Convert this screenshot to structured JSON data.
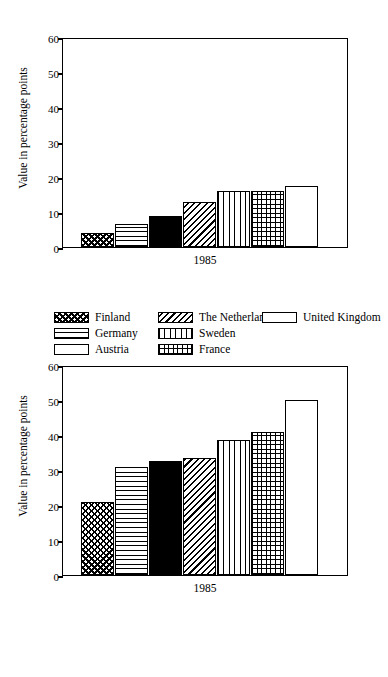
{
  "clipped_top_text": "",
  "figures": [
    {
      "id": "figure-1",
      "ylabel": "Value in percentage points",
      "xlabel": "1985",
      "yticks": [
        "0",
        "10",
        "20",
        "30",
        "40",
        "50",
        "60"
      ],
      "legend": [
        [
          "Finland",
          "Germany",
          "Austria"
        ],
        [
          "The Netherlands",
          "Sweden",
          "France"
        ],
        [
          "United Kingdom"
        ]
      ]
    },
    {
      "id": "figure-2",
      "ylabel": "Value in percentage points",
      "xlabel": "1985",
      "yticks": [
        "0",
        "10",
        "20",
        "30",
        "40",
        "50",
        "60"
      ],
      "legend": [
        [
          "Denmark",
          "Belgium",
          "Italy"
        ],
        [
          "Spain",
          "Portugal",
          "Ireland"
        ],
        [
          "Greece"
        ]
      ]
    }
  ],
  "chart_data": [
    {
      "type": "bar",
      "title": "",
      "xlabel": "1985",
      "ylabel": "Value in percentage points",
      "ylim": [
        0,
        60
      ],
      "yticks": [
        0,
        10,
        20,
        30,
        40,
        50,
        60
      ],
      "grid": false,
      "legend_position": "below",
      "categories": [
        "Finland",
        "Germany",
        "Austria",
        "The Netherlands",
        "Sweden",
        "France",
        "United Kingdom"
      ],
      "values": [
        4,
        6.5,
        9,
        13,
        16,
        16,
        17.5
      ],
      "patterns": [
        "checker",
        "horizontal-lines",
        "solid-black",
        "diagonal-lines",
        "vertical-lines",
        "grid",
        "empty"
      ]
    },
    {
      "type": "bar",
      "title": "",
      "xlabel": "1985",
      "ylabel": "Value in percentage points",
      "ylim": [
        0,
        60
      ],
      "yticks": [
        0,
        10,
        20,
        30,
        40,
        50,
        60
      ],
      "grid": false,
      "legend_position": "below",
      "categories": [
        "Denmark",
        "Belgium",
        "Italy",
        "Spain",
        "Portugal",
        "Ireland",
        "Greece"
      ],
      "values": [
        21,
        31,
        32.5,
        33.5,
        38.5,
        41,
        50
      ],
      "patterns": [
        "checker",
        "horizontal-lines",
        "solid-black",
        "diagonal-lines",
        "vertical-lines",
        "grid",
        "empty"
      ]
    }
  ]
}
